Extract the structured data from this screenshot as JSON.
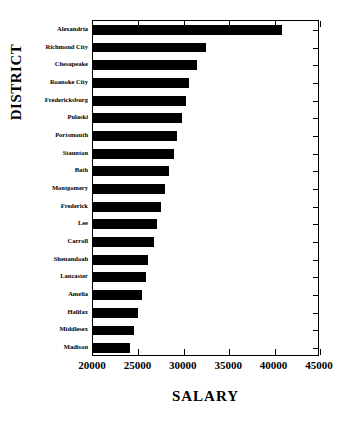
{
  "chart_data": {
    "type": "bar",
    "orientation": "horizontal",
    "title": "",
    "xlabel": "SALARY",
    "ylabel": "DISTRICT",
    "xlim": [
      20000,
      45000
    ],
    "xticks": [
      20000,
      25000,
      30000,
      35000,
      40000,
      45000
    ],
    "xtick_labels": [
      "20000",
      "25000",
      "30000",
      "35000",
      "40000",
      "45000"
    ],
    "grid": false,
    "legend": false,
    "categories": [
      "Alexandria",
      "Richmond City",
      "Chesapeake",
      "Roanoke City",
      "Fredericksburg",
      "Pulaski",
      "Portsmouth",
      "Staunton",
      "Bath",
      "Montgomery",
      "Frederick",
      "Lee",
      "Carroll",
      "Shenandoah",
      "Lancaster",
      "Amelia",
      "Halifax",
      "Middlesex",
      "Madison"
    ],
    "values": [
      40800,
      32400,
      31500,
      30600,
      30200,
      29800,
      29200,
      28900,
      28400,
      27900,
      27500,
      27100,
      26700,
      26100,
      25800,
      25400,
      25000,
      24500,
      24100
    ]
  },
  "style": {
    "bar_color": "#000000",
    "axis_color": "#000000",
    "background": "#ffffff"
  }
}
